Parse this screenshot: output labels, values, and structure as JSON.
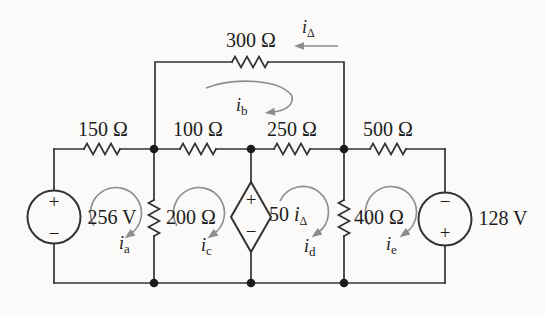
{
  "colors": {
    "background": "#fbfaf8",
    "wire": "#333333",
    "node": "#1a1a1a",
    "text": "#1c1c1c",
    "arrow": "#8d8d8d"
  },
  "resistors": {
    "r300": "300 Ω",
    "r150": "150 Ω",
    "r100": "100 Ω",
    "r250": "250 Ω",
    "r500": "500 Ω",
    "r200": "200 Ω",
    "r400": "400 Ω"
  },
  "sources": {
    "left": {
      "value": "256 V",
      "top_sign": "+",
      "bottom_sign": "−"
    },
    "right": {
      "value": "128 V",
      "top_sign": "−",
      "bottom_sign": "+"
    },
    "dependent": {
      "coefficient": "50",
      "symbol": "i",
      "subscript": "Δ",
      "top_sign": "+",
      "bottom_sign": "−"
    }
  },
  "currents": {
    "delta": {
      "symbol": "i",
      "subscript": "Δ"
    },
    "a": {
      "symbol": "i",
      "subscript": "a"
    },
    "b": {
      "symbol": "i",
      "subscript": "b"
    },
    "c": {
      "symbol": "i",
      "subscript": "c"
    },
    "d": {
      "symbol": "i",
      "subscript": "d"
    },
    "e": {
      "symbol": "i",
      "subscript": "e"
    }
  }
}
